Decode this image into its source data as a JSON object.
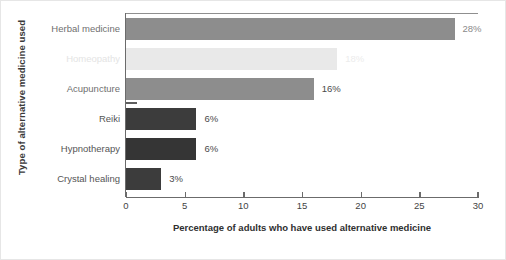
{
  "chart_data": {
    "type": "bar",
    "orientation": "horizontal",
    "title": "",
    "xlabel": "Percentage of adults who have used alternative medicine",
    "ylabel": "Type of alternative medicine used",
    "xlim": [
      0,
      30
    ],
    "ylim": null,
    "grid": false,
    "legend": null,
    "xticks": [
      0,
      5,
      10,
      15,
      20,
      25,
      30
    ],
    "xtick_labels": [
      "0",
      "5",
      "10",
      "15",
      "20",
      "25",
      "30"
    ],
    "categories": [
      "Herbal medicine",
      "Homeopathy",
      "Acupuncture",
      "Reiki",
      "Hypnotherapy",
      "Crystal healing"
    ],
    "values": [
      28,
      18,
      16,
      6,
      6,
      3
    ],
    "data_labels": [
      "28%",
      "18%",
      "16%",
      "6%",
      "6%",
      "3%"
    ],
    "bar_colors": [
      "#8d8d8d",
      "#e9e9e9",
      "#8d8d8d",
      "#3c3c3c",
      "#353535",
      "#3c3c3c"
    ],
    "label_colors": [
      "#6f6f6f",
      "#e4e4e4",
      "#6f6f6f",
      "#555555",
      "#555555",
      "#555555"
    ],
    "value_label_colors": [
      "#8a8a8a",
      "#ececec",
      "#4a4a4a",
      "#4a4a4a",
      "#4a4a4a",
      "#4a4a4a"
    ]
  }
}
